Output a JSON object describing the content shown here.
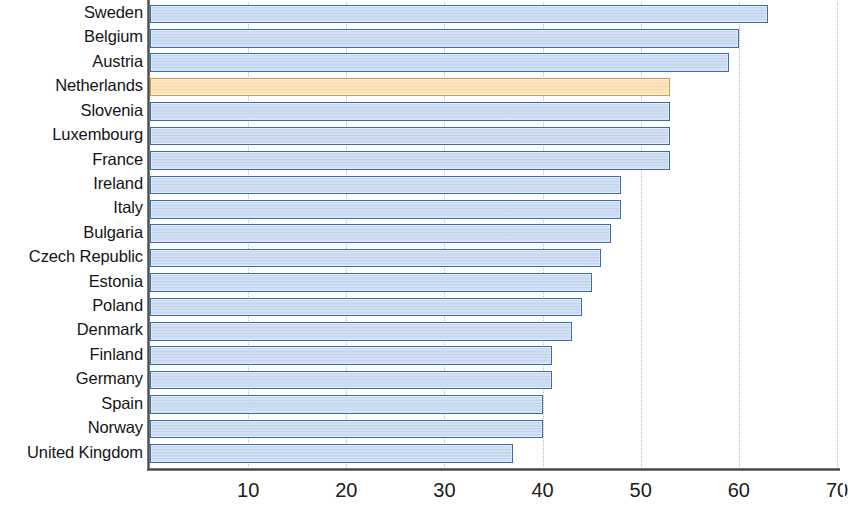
{
  "chart_data": {
    "type": "bar",
    "orientation": "horizontal",
    "title": "",
    "subtitle": "",
    "xlabel": "",
    "ylabel": "",
    "xlim": [
      0,
      70
    ],
    "xticks": [
      10,
      20,
      30,
      40,
      50,
      60,
      70
    ],
    "xtick_labels": [
      "10",
      "20",
      "30",
      "40",
      "50",
      "60",
      "70"
    ],
    "grid": "vertical-dotted",
    "legend": null,
    "categories": [
      "Sweden",
      "Belgium",
      "Austria",
      "Netherlands",
      "Slovenia",
      "Luxembourg",
      "France",
      "Ireland",
      "Italy",
      "Bulgaria",
      "Czech Republic",
      "Estonia",
      "Poland",
      "Denmark",
      "Finland",
      "Germany",
      "Spain",
      "Norway",
      "United Kingdom"
    ],
    "values": [
      63,
      60,
      59,
      53,
      53,
      53,
      53,
      48,
      48,
      47,
      46,
      45,
      44,
      43,
      41,
      41,
      40,
      40,
      37
    ],
    "highlight_category": "Netherlands",
    "colors": {
      "bar_fill": "#c3d5ef",
      "bar_border": "#3a6cb0",
      "highlight_fill": "#fbdfae",
      "highlight_border": "#d2993f",
      "gridline": "#b9b9b9",
      "axis": "#3f3f3f",
      "text": "#141414",
      "background": "#ffffff"
    }
  }
}
